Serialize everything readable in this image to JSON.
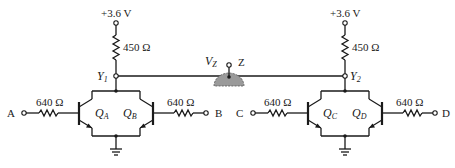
{
  "circuit": {
    "supply_voltage": "+3.6 V",
    "wired_and": {
      "voltage_label": "V",
      "voltage_sub": "Z",
      "output_label": "Z",
      "fill_color": "#9a9a9a"
    },
    "left": {
      "supply_label": "+3.6 V",
      "pullup_resistor": "450 Ω",
      "node_label": "Y",
      "node_sub": "1",
      "input_a": {
        "label": "A",
        "resistor": "640 Ω"
      },
      "input_b": {
        "label": "B",
        "resistor": "640 Ω"
      },
      "transistor_a": {
        "label": "Q",
        "sub": "A"
      },
      "transistor_b": {
        "label": "Q",
        "sub": "B"
      }
    },
    "right": {
      "supply_label": "+3.6 V",
      "pullup_resistor": "450 Ω",
      "node_label": "Y",
      "node_sub": "2",
      "input_c": {
        "label": "C",
        "resistor": "640 Ω"
      },
      "input_d": {
        "label": "D",
        "resistor": "640 Ω"
      },
      "transistor_c": {
        "label": "Q",
        "sub": "C"
      },
      "transistor_d": {
        "label": "Q",
        "sub": "D"
      }
    }
  }
}
